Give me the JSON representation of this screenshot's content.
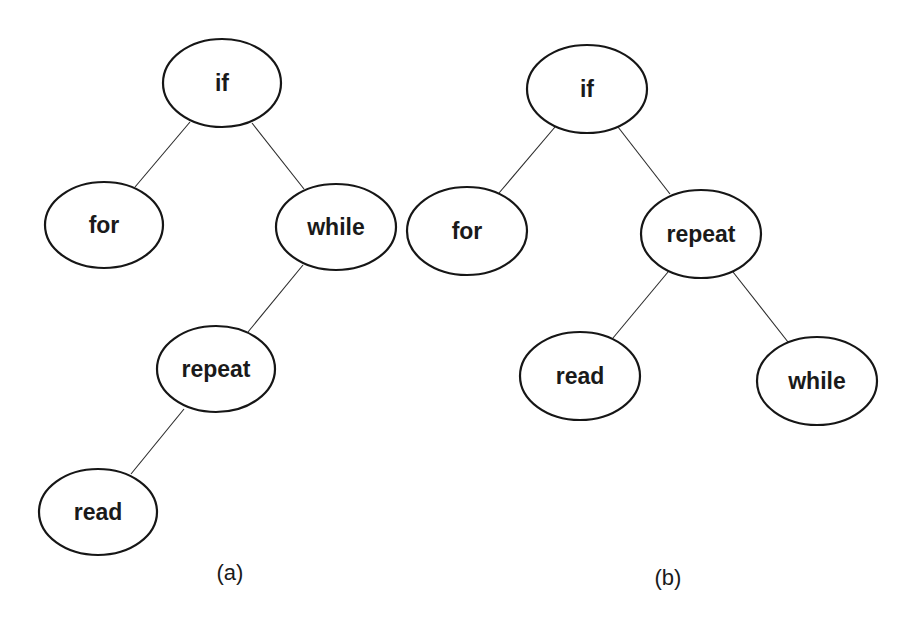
{
  "diagram": {
    "type": "binary-search-trees",
    "trees": [
      {
        "id": "a",
        "caption": "(a)",
        "caption_pos": [
          230,
          572
        ],
        "nodes": [
          {
            "id": "a_if",
            "label": "if",
            "cx": 222,
            "cy": 83,
            "rx": 59,
            "ry": 44
          },
          {
            "id": "a_for",
            "label": "for",
            "cx": 104,
            "cy": 225,
            "rx": 59,
            "ry": 43
          },
          {
            "id": "a_while",
            "label": "while",
            "cx": 336,
            "cy": 227,
            "rx": 60,
            "ry": 43
          },
          {
            "id": "a_repeat",
            "label": "repeat",
            "cx": 216,
            "cy": 369,
            "rx": 59,
            "ry": 43
          },
          {
            "id": "a_read",
            "label": "read",
            "cx": 98,
            "cy": 512,
            "rx": 59,
            "ry": 43
          }
        ],
        "edges": [
          {
            "from": "if",
            "to": "for",
            "x1": 190,
            "y1": 122,
            "x2": 135,
            "y2": 187
          },
          {
            "from": "if",
            "to": "while",
            "x1": 252,
            "y1": 123,
            "x2": 304,
            "y2": 189
          },
          {
            "from": "while",
            "to": "repeat",
            "x1": 303,
            "y1": 265,
            "x2": 248,
            "y2": 332
          },
          {
            "from": "repeat",
            "to": "read",
            "x1": 184,
            "y1": 409,
            "x2": 131,
            "y2": 474
          }
        ]
      },
      {
        "id": "b",
        "caption": "(b)",
        "caption_pos": [
          668,
          577
        ],
        "nodes": [
          {
            "id": "b_if",
            "label": "if",
            "cx": 587,
            "cy": 89,
            "rx": 60,
            "ry": 44
          },
          {
            "id": "b_for",
            "label": "for",
            "cx": 467,
            "cy": 231,
            "rx": 60,
            "ry": 44
          },
          {
            "id": "b_repeat",
            "label": "repeat",
            "cx": 701,
            "cy": 234,
            "rx": 60,
            "ry": 44
          },
          {
            "id": "b_read",
            "label": "read",
            "cx": 580,
            "cy": 376,
            "rx": 60,
            "ry": 44
          },
          {
            "id": "b_while",
            "label": "while",
            "cx": 817,
            "cy": 381,
            "rx": 60,
            "ry": 44
          }
        ],
        "edges": [
          {
            "from": "if",
            "to": "for",
            "x1": 555,
            "y1": 127,
            "x2": 499,
            "y2": 193
          },
          {
            "from": "if",
            "to": "repeat",
            "x1": 618,
            "y1": 127,
            "x2": 670,
            "y2": 194
          },
          {
            "from": "repeat",
            "to": "read",
            "x1": 668,
            "y1": 272,
            "x2": 613,
            "y2": 338
          },
          {
            "from": "repeat",
            "to": "while",
            "x1": 733,
            "y1": 272,
            "x2": 788,
            "y2": 342
          }
        ]
      }
    ]
  }
}
